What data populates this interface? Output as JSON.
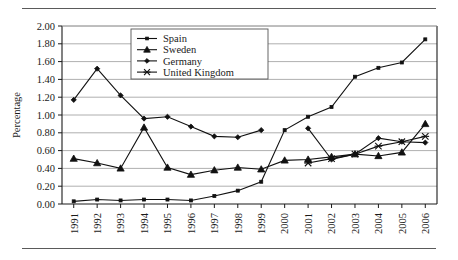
{
  "chart_data": {
    "type": "line",
    "title": "",
    "xlabel": "",
    "ylabel": "Percentage",
    "ylim": [
      0.0,
      2.0
    ],
    "ytick_step": 0.2,
    "grid": true,
    "legend_position": "top-center-inside",
    "x": [
      "1991",
      "1992",
      "1993",
      "1994",
      "1995",
      "1996",
      "1997",
      "1998",
      "1999",
      "2000",
      "2001",
      "2002",
      "2003",
      "2004",
      "2005",
      "2006"
    ],
    "ytick_labels": [
      "0.00",
      "0.20",
      "0.40",
      "0.60",
      "0.80",
      "1.00",
      "1.20",
      "1.40",
      "1.60",
      "1.80",
      "2.00"
    ],
    "series": [
      {
        "name": "Spain",
        "marker": "square",
        "values": [
          0.03,
          0.05,
          0.04,
          0.05,
          0.05,
          0.04,
          0.09,
          0.15,
          0.25,
          0.83,
          0.98,
          1.09,
          1.43,
          1.53,
          1.59,
          1.85
        ]
      },
      {
        "name": "Sweden",
        "marker": "triangle",
        "values": [
          0.51,
          0.46,
          0.4,
          0.86,
          0.41,
          0.33,
          0.38,
          0.41,
          0.39,
          0.49,
          0.5,
          0.53,
          0.56,
          0.54,
          0.58,
          0.9
        ]
      },
      {
        "name": "Germany",
        "marker": "diamond",
        "values": [
          1.17,
          1.52,
          1.22,
          0.96,
          0.98,
          0.87,
          0.76,
          0.75,
          0.83,
          null,
          0.85,
          0.5,
          0.56,
          0.74,
          0.7,
          0.69
        ]
      },
      {
        "name": "United Kingdom",
        "marker": "star",
        "values": [
          null,
          null,
          null,
          null,
          null,
          null,
          null,
          null,
          null,
          null,
          0.46,
          0.51,
          0.56,
          0.65,
          0.7,
          0.76
        ]
      }
    ]
  },
  "legend": {
    "items": [
      {
        "label": "Spain"
      },
      {
        "label": "Sweden"
      },
      {
        "label": "Germany"
      },
      {
        "label": "United Kingdom"
      }
    ]
  },
  "axes": {
    "y_title": "Percentage"
  }
}
